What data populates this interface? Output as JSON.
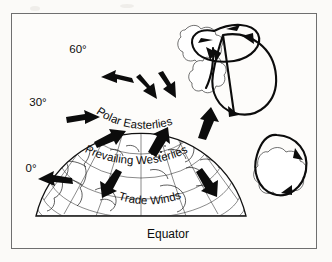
{
  "figure": {
    "background_color": "#fbfaf8",
    "ink_color": "#111111",
    "frame_color": "#6f6f6f"
  },
  "latitude_labels": [
    {
      "id": "lat-60",
      "text": "60°",
      "x": 78,
      "y": 53
    },
    {
      "id": "lat-30",
      "text": "30°",
      "x": 38,
      "y": 106
    },
    {
      "id": "lat-0",
      "text": "0°",
      "x": 31,
      "y": 172
    }
  ],
  "wind_belts": [
    {
      "id": "polar-easterlies",
      "text": "Polar Easterlies",
      "curved": true
    },
    {
      "id": "prevailing-westerlies",
      "text": "Prevailing Westerlies",
      "curved": true
    },
    {
      "id": "trade-winds",
      "text": "Trade Winds",
      "curved": true
    }
  ],
  "equator_label": {
    "id": "equator",
    "text": "Equator",
    "x": 168,
    "y": 238
  },
  "globe": {
    "center_x": 140,
    "pole_x": 140,
    "pole_y": 58,
    "left_edge_x": 36,
    "right_edge_x": 246,
    "top_y": 47,
    "bottom_y": 216,
    "graticule": "latitude and longitude grid",
    "continents": "world coastlines on northern hemisphere"
  },
  "wind_arrows": [
    {
      "id": "arrow-polar-1",
      "belt": "polar-easterlies",
      "direction": "west-southwest"
    },
    {
      "id": "arrow-polar-2",
      "belt": "polar-easterlies",
      "direction": "southeast"
    },
    {
      "id": "arrow-polar-3",
      "belt": "polar-easterlies",
      "direction": "south-southeast"
    },
    {
      "id": "arrow-westerly-1",
      "belt": "prevailing-westerlies",
      "direction": "east-northeast"
    },
    {
      "id": "arrow-westerly-2",
      "belt": "prevailing-westerlies",
      "direction": "northeast"
    },
    {
      "id": "arrow-westerly-3",
      "belt": "prevailing-westerlies",
      "direction": "north-northeast"
    },
    {
      "id": "arrow-westerly-4",
      "belt": "prevailing-westerlies",
      "direction": "north"
    },
    {
      "id": "arrow-trade-1",
      "belt": "trade-winds",
      "direction": "west"
    },
    {
      "id": "arrow-trade-2",
      "belt": "trade-winds",
      "direction": "southwest"
    },
    {
      "id": "arrow-trade-3",
      "belt": "trade-winds",
      "direction": "southeast"
    }
  ],
  "circulation_cells": [
    {
      "id": "cell-upper",
      "shape": "horizontal-loop",
      "rotation": "clockwise",
      "clouds": true
    },
    {
      "id": "cell-middle",
      "shape": "tall-loop",
      "rotation": "counter-clockwise",
      "clouds": true
    },
    {
      "id": "cell-lower",
      "shape": "oval-loop",
      "rotation": "clockwise",
      "clouds": true
    }
  ]
}
